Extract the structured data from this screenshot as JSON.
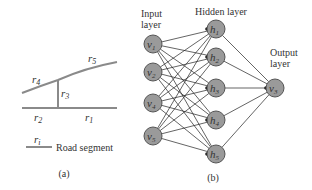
{
  "panel_a": {
    "caption": "(a)",
    "segments": {
      "r1": {
        "base": "r",
        "sub": "1"
      },
      "r2": {
        "base": "r",
        "sub": "2"
      },
      "r3": {
        "base": "r",
        "sub": "3"
      },
      "r4": {
        "base": "r",
        "sub": "4"
      },
      "r5": {
        "base": "r",
        "sub": "5"
      }
    },
    "legend": {
      "symbol_base": "r",
      "symbol_sub": "i",
      "label": "Road segment"
    },
    "road_color": "#8a8a8a"
  },
  "panel_b": {
    "caption": "(b)",
    "input_label_1": "Input",
    "input_label_2": "layer",
    "hidden_label": "Hidden layer",
    "output_label_1": "Output",
    "output_label_2": "layer",
    "input_nodes": [
      {
        "base": "v",
        "sub": "1"
      },
      {
        "base": "v",
        "sub": "2"
      },
      {
        "base": "v",
        "sub": "4"
      },
      {
        "base": "v",
        "sub": "5"
      }
    ],
    "hidden_nodes": [
      {
        "base": "h",
        "sub": "1"
      },
      {
        "base": "h",
        "sub": "2"
      },
      {
        "base": "h",
        "sub": "3"
      },
      {
        "base": "h",
        "sub": "4"
      },
      {
        "base": "h",
        "sub": "5"
      }
    ],
    "output_nodes": [
      {
        "base": "v",
        "sub": "3"
      }
    ],
    "node_fill": "#9a9a9a",
    "node_stroke": "#555555",
    "edge_color": "#222222"
  }
}
